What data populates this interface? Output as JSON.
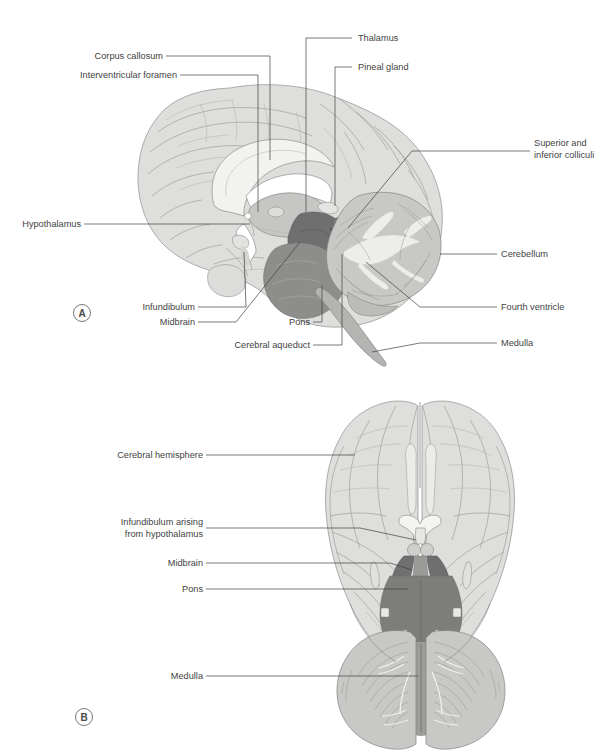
{
  "figure": {
    "background_color": "#ffffff",
    "text_color": "#3f3f3f",
    "leader_color": "#3f3f3f"
  },
  "panel_a": {
    "marker": "A",
    "view": "midsagittal section of the brain",
    "labels": {
      "corpus_callosum": "Corpus callosum",
      "interventricular_foramen": "Interventricular foramen",
      "thalamus": "Thalamus",
      "pineal_gland": "Pineal gland",
      "superior_inferior_colliculi_line1": "Superior and",
      "superior_inferior_colliculi_line2": "inferior colliculi",
      "hypothalamus": "Hypothalamus",
      "cerebellum": "Cerebellum",
      "fourth_ventricle": "Fourth ventricle",
      "medulla": "Medulla",
      "infundibulum": "Infundibulum",
      "midbrain": "Midbrain",
      "pons": "Pons",
      "cerebral_aqueduct": "Cerebral aqueduct"
    }
  },
  "panel_b": {
    "marker": "B",
    "view": "inferior view of the brain",
    "labels": {
      "cerebral_hemisphere": "Cerebral hemisphere",
      "infundibulum_line1": "Infundibulum arising",
      "infundibulum_line2": "from hypothalamus",
      "midbrain": "Midbrain",
      "pons": "Pons",
      "medulla": "Medulla"
    }
  },
  "colors": {
    "cortex": "#dededc",
    "corpus_callosum": "#f2f2f0",
    "thalamus": "#c6c6c4",
    "midbrain": "#6f6f6f",
    "pons": "#8d8d8b",
    "medulla": "#b4b4b2",
    "cerebellum": "#c8c8c6",
    "ventricle": "#ffffff"
  }
}
